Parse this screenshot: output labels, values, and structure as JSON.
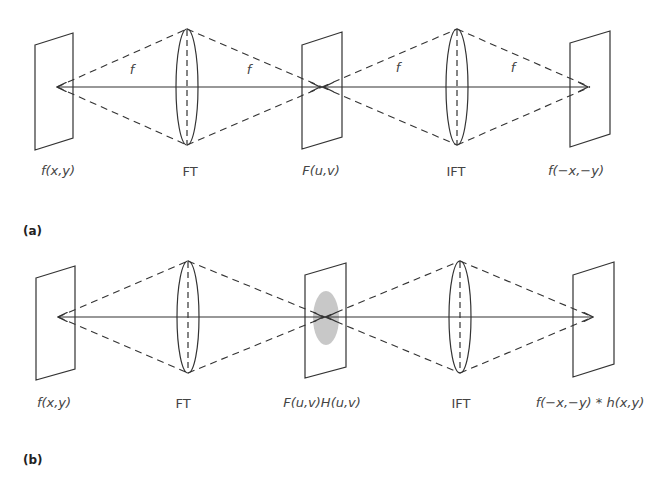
{
  "figure": {
    "panels": [
      {
        "id": "a",
        "panel_label": "(a)",
        "planes": [
          {
            "label": "f(x,y)"
          },
          {
            "label": "F(u,v)"
          },
          {
            "label": "f(−x,−y)"
          }
        ],
        "lenses": [
          {
            "label": "FT"
          },
          {
            "label": "IFT"
          }
        ],
        "focal_labels": [
          "f",
          "f",
          "f",
          "f"
        ],
        "filter_shown": false
      },
      {
        "id": "b",
        "panel_label": "(b)",
        "planes": [
          {
            "label": "f(x,y)"
          },
          {
            "label": "F(u,v)H(u,v)"
          },
          {
            "label": "f(−x,−y) * h(x,y)"
          }
        ],
        "lenses": [
          {
            "label": "FT"
          },
          {
            "label": "IFT"
          }
        ],
        "focal_labels": [],
        "filter_shown": true
      }
    ],
    "colors": {
      "line": "#333333",
      "filter": "#c8c8c8",
      "text": "#444444"
    }
  }
}
